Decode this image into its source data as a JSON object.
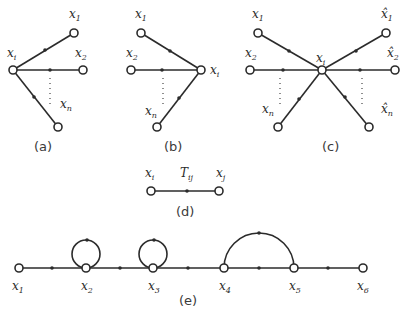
{
  "figure": {
    "panel_a": {
      "caption": "(a)",
      "center": {
        "name": "x",
        "sub": "i"
      },
      "nodes": [
        {
          "name": "x",
          "sub": "1"
        },
        {
          "name": "x",
          "sub": "2"
        },
        {
          "name": "x",
          "sub": "n"
        }
      ],
      "edge_direction": "outgoing from x_i"
    },
    "panel_b": {
      "caption": "(b)",
      "center": {
        "name": "x",
        "sub": "i"
      },
      "nodes": [
        {
          "name": "x",
          "sub": "1"
        },
        {
          "name": "x",
          "sub": "2"
        },
        {
          "name": "x",
          "sub": "n"
        }
      ],
      "edge_direction": "incoming to x_i"
    },
    "panel_c": {
      "caption": "(c)",
      "center": {
        "name": "x",
        "sub": "i"
      },
      "inputs": [
        {
          "name": "x",
          "sub": "1"
        },
        {
          "name": "x",
          "sub": "2"
        },
        {
          "name": "x",
          "sub": "n"
        }
      ],
      "outputs": [
        {
          "name": "x̂",
          "sub": "1"
        },
        {
          "name": "x̂",
          "sub": "2"
        },
        {
          "name": "x̂",
          "sub": "n"
        }
      ]
    },
    "panel_d": {
      "caption": "(d)",
      "from": {
        "name": "x",
        "sub": "i"
      },
      "to": {
        "name": "x",
        "sub": "j"
      },
      "gain": {
        "name": "T",
        "sub": "ij"
      }
    },
    "panel_e": {
      "caption": "(e)",
      "nodes": [
        {
          "name": "x",
          "sub": "1"
        },
        {
          "name": "x",
          "sub": "2"
        },
        {
          "name": "x",
          "sub": "3"
        },
        {
          "name": "x",
          "sub": "4"
        },
        {
          "name": "x",
          "sub": "5"
        },
        {
          "name": "x",
          "sub": "6"
        }
      ],
      "self_loops": [
        "x2",
        "x3"
      ],
      "arc": {
        "from": "x4",
        "to": "x5"
      }
    }
  }
}
